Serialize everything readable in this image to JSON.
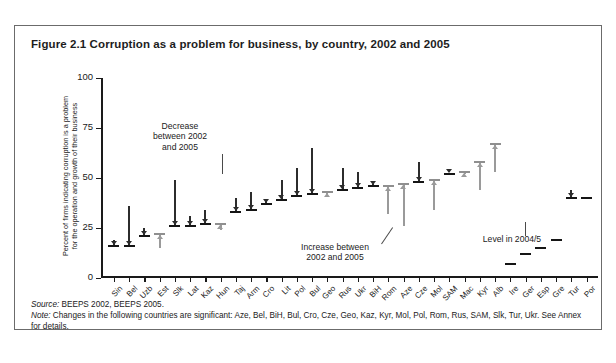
{
  "figure": {
    "title": "Figure 2.1  Corruption as a problem for business, by country, 2002 and 2005",
    "source_lead": "Source:",
    "source_text": " BEEPS 2002, BEEPS 2005.",
    "note_lead": "Note:",
    "note_text": " Changes in the following countries are significant: Aze, Bel, BiH, Bul, Cro, Cze, Geo, Kaz, Kyr, Mol, Pol, Rom, Rus, SAM, Slk, Tur, Ukr. See Annex for details."
  },
  "annotations": {
    "decrease": "Decrease\nbetween 2002\nand 2005",
    "increase": "Increase between\n2002 and 2005",
    "level": "Level in 2004/5"
  },
  "colors": {
    "decrease_marker": "#2c2c2c",
    "increase_marker": "#9a9a9a",
    "axis": "#1a1a1a",
    "border": "#6b6b6b"
  },
  "chart_data": {
    "type": "bar",
    "title": "Corruption as a problem for business, by country, 2002 and 2005",
    "subtitle": "",
    "xlabel": "",
    "ylabel": "Percent of firms indicating corruption is a problem for the operation and growth of their business",
    "ylabel_line1": "Percent of firms indicating corruption is a problem",
    "ylabel_line2": "for the operation and growth of their business",
    "ylim": [
      0,
      100
    ],
    "yticks": [
      0,
      25,
      50,
      75,
      100
    ],
    "grid": false,
    "legend_position": "none",
    "series_names": [
      "2002",
      "2005",
      "2004/5 level (EU comparators)"
    ],
    "categories": [
      "Sin",
      "Bel",
      "Uzb",
      "Est",
      "Slk",
      "Lat",
      "Kaz",
      "Hun",
      "Taj",
      "Arm",
      "Cro",
      "Lit",
      "Pol",
      "Bul",
      "Geo",
      "Rus",
      "Ukr",
      "BiH",
      "Rom",
      "Aze",
      "Cze",
      "Mol",
      "SAM",
      "Mac",
      "Kyr",
      "Alb",
      "Ire",
      "Ger",
      "Esp",
      "Gre",
      "Tur",
      "Por"
    ],
    "points": [
      {
        "country": "Sin",
        "v2002": 19,
        "v2005": 16,
        "direction": "decrease"
      },
      {
        "country": "Bel",
        "v2002": 36,
        "v2005": 16,
        "direction": "decrease"
      },
      {
        "country": "Uzb",
        "v2002": 25,
        "v2005": 21,
        "direction": "decrease"
      },
      {
        "country": "Est",
        "v2002": 15,
        "v2005": 22,
        "direction": "increase"
      },
      {
        "country": "Slk",
        "v2002": 49,
        "v2005": 26,
        "direction": "decrease"
      },
      {
        "country": "Lat",
        "v2002": 31,
        "v2005": 26,
        "direction": "decrease"
      },
      {
        "country": "Kaz",
        "v2002": 34,
        "v2005": 27,
        "direction": "decrease"
      },
      {
        "country": "Hun",
        "v2002": 24,
        "v2005": 27,
        "direction": "increase"
      },
      {
        "country": "Taj",
        "v2002": 40,
        "v2005": 33,
        "direction": "decrease"
      },
      {
        "country": "Arm",
        "v2002": 43,
        "v2005": 34,
        "direction": "decrease"
      },
      {
        "country": "Cro",
        "v2002": 39,
        "v2005": 37,
        "direction": "decrease"
      },
      {
        "country": "Lit",
        "v2002": 49,
        "v2005": 39,
        "direction": "decrease"
      },
      {
        "country": "Pol",
        "v2002": 55,
        "v2005": 41,
        "direction": "decrease"
      },
      {
        "country": "Bul",
        "v2002": 65,
        "v2005": 42,
        "direction": "decrease"
      },
      {
        "country": "Geo",
        "v2002": 42,
        "v2005": 43,
        "direction": "increase"
      },
      {
        "country": "Rus",
        "v2002": 55,
        "v2005": 44,
        "direction": "decrease"
      },
      {
        "country": "Ukr",
        "v2002": 53,
        "v2005": 45,
        "direction": "decrease"
      },
      {
        "country": "BiH",
        "v2002": 47,
        "v2005": 46,
        "direction": "decrease"
      },
      {
        "country": "Rom",
        "v2002": 32,
        "v2005": 46,
        "direction": "increase"
      },
      {
        "country": "Aze",
        "v2002": 26,
        "v2005": 47,
        "direction": "increase"
      },
      {
        "country": "Cze",
        "v2002": 58,
        "v2005": 48,
        "direction": "decrease"
      },
      {
        "country": "Mol",
        "v2002": 34,
        "v2005": 49,
        "direction": "increase"
      },
      {
        "country": "SAM",
        "v2002": 52,
        "v2005": 52,
        "direction": "decrease"
      },
      {
        "country": "Mac",
        "v2002": 52,
        "v2005": 53,
        "direction": "increase"
      },
      {
        "country": "Kyr",
        "v2002": 44,
        "v2005": 58,
        "direction": "increase"
      },
      {
        "country": "Alb",
        "v2002": 53,
        "v2005": 67,
        "direction": "increase"
      },
      {
        "country": "Ire",
        "v2002": null,
        "v2005": 7,
        "direction": "level"
      },
      {
        "country": "Ger",
        "v2002": null,
        "v2005": 12,
        "direction": "level"
      },
      {
        "country": "Esp",
        "v2002": null,
        "v2005": 15,
        "direction": "level"
      },
      {
        "country": "Gre",
        "v2002": null,
        "v2005": 19,
        "direction": "level"
      },
      {
        "country": "Tur",
        "v2002": 44,
        "v2005": 40,
        "direction": "decrease"
      },
      {
        "country": "Por",
        "v2002": null,
        "v2005": 40,
        "direction": "level"
      }
    ]
  }
}
